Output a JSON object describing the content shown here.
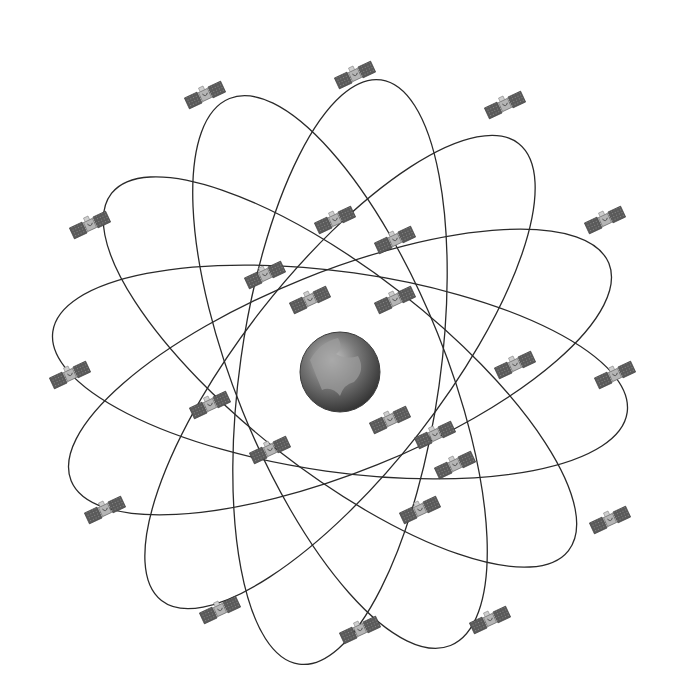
{
  "diagram": {
    "type": "satellite-constellation",
    "background": "#ffffff",
    "orbit_color": "#2a2a2a",
    "earth": {
      "cx": 340,
      "cy": 372,
      "r": 40
    },
    "orbits": [
      {
        "angle": 8,
        "rx": 290,
        "ry": 100
      },
      {
        "angle": 38,
        "rx": 290,
        "ry": 100
      },
      {
        "angle": 68,
        "rx": 295,
        "ry": 105
      },
      {
        "angle": 98,
        "rx": 295,
        "ry": 100
      },
      {
        "angle": 128,
        "rx": 290,
        "ry": 100
      },
      {
        "angle": 158,
        "rx": 290,
        "ry": 100
      }
    ],
    "satellites": [
      {
        "x": 205,
        "y": 95,
        "rot": -25
      },
      {
        "x": 355,
        "y": 75,
        "rot": -25
      },
      {
        "x": 505,
        "y": 105,
        "rot": -25
      },
      {
        "x": 90,
        "y": 225,
        "rot": -25
      },
      {
        "x": 335,
        "y": 220,
        "rot": -25
      },
      {
        "x": 605,
        "y": 220,
        "rot": -25
      },
      {
        "x": 265,
        "y": 275,
        "rot": -25
      },
      {
        "x": 395,
        "y": 240,
        "rot": -25
      },
      {
        "x": 310,
        "y": 300,
        "rot": -25
      },
      {
        "x": 395,
        "y": 300,
        "rot": -25
      },
      {
        "x": 70,
        "y": 375,
        "rot": -25
      },
      {
        "x": 515,
        "y": 365,
        "rot": -25
      },
      {
        "x": 615,
        "y": 375,
        "rot": -25
      },
      {
        "x": 210,
        "y": 405,
        "rot": -25
      },
      {
        "x": 390,
        "y": 420,
        "rot": -25
      },
      {
        "x": 270,
        "y": 450,
        "rot": -25
      },
      {
        "x": 435,
        "y": 435,
        "rot": -25
      },
      {
        "x": 455,
        "y": 465,
        "rot": -25
      },
      {
        "x": 105,
        "y": 510,
        "rot": -25
      },
      {
        "x": 420,
        "y": 510,
        "rot": -25
      },
      {
        "x": 610,
        "y": 520,
        "rot": -25
      },
      {
        "x": 220,
        "y": 610,
        "rot": -25
      },
      {
        "x": 360,
        "y": 630,
        "rot": -25
      },
      {
        "x": 490,
        "y": 620,
        "rot": -25
      }
    ]
  }
}
